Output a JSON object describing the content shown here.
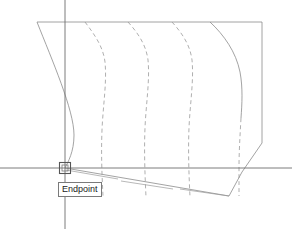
{
  "app": {
    "kind": "cad-drawing-viewport",
    "background_color": "#ffffff"
  },
  "viewport": {
    "width": 292,
    "height": 229
  },
  "osnap": {
    "tooltip_label": "Endpoint",
    "marker_name": "endpoint-square-marker",
    "marker_x": 65,
    "marker_y": 168,
    "marker_size": 11,
    "marker_color": "#555555",
    "tooltip_border_color": "#7a7a7a",
    "tooltip_text_color": "#1a1a1a",
    "tooltip_background_color": "#ffffff"
  },
  "crosshair": {
    "x": 65,
    "y": 168,
    "color": "#6e6e6e",
    "vertical_from_y": 0,
    "vertical_to_y": 229,
    "horizontal_from_x": 0,
    "horizontal_to_x": 292
  },
  "geometry": {
    "visible_line_color": "#8c8c8c",
    "hidden_line_color": "#9a9a9a",
    "hidden_dash_pattern": "4,3",
    "stroke_width": 0.8,
    "top_edge": {
      "label": "top-edge-polyline",
      "points": "37,22 262,22"
    },
    "right_edge": {
      "label": "right-edge-polyline",
      "points": "262,22 262,143 242,172"
    },
    "bottom_edge": {
      "label": "bottom-edge-polyline",
      "points": "65,168 229,196 242,172"
    },
    "profile_curves": [
      {
        "name": "profile-curve-1",
        "style": "solid",
        "path": "M37,22 C52,60 74,110 74,135 C74,152 68,162 65,168"
      },
      {
        "name": "profile-curve-2",
        "style": "hidden",
        "path": "M85,22 C94,34 103,46 105,62 C107,82 103,106 102,130 C101,154 102,176 103,196"
      },
      {
        "name": "profile-curve-3",
        "style": "hidden",
        "path": "M128,22 C137,32 146,44 148,60 C150,80 146,104 145,128 C144,152 145,176 146,197"
      },
      {
        "name": "profile-curve-4",
        "style": "hidden",
        "path": "M172,22 C181,32 190,44 192,60 C194,80 190,104 189,128 C188,152 189,176 190,197"
      },
      {
        "name": "profile-curve-5-solid-part",
        "style": "solid",
        "path": "M210,22 C224,35 236,52 240,72 C243,88 242,104 241,118"
      },
      {
        "name": "profile-curve-5-hidden-part",
        "style": "hidden",
        "path": "M241,118 C240,136 239,152 239,168 C239,182 239,190 239,196"
      }
    ],
    "bottom_hatch_segments": [
      {
        "name": "bottom-hatch-1",
        "points": "66,170 118,179"
      },
      {
        "name": "bottom-hatch-2",
        "points": "121,181 173,189"
      },
      {
        "name": "bottom-hatch-3",
        "points": "180,189 229,196"
      }
    ]
  }
}
